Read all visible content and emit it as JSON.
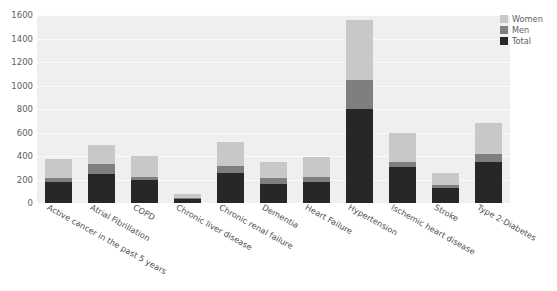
{
  "chart_data": {
    "type": "bar",
    "stacked": false,
    "overlaid": true,
    "title": "",
    "xlabel": "",
    "ylabel": "",
    "ylim": [
      0,
      1600
    ],
    "ytick_step": 200,
    "yticks": [
      "0",
      "200",
      "400",
      "600",
      "800",
      "1000",
      "1200",
      "1400",
      "1600"
    ],
    "grid": true,
    "grid_axis": "y",
    "legend_position": "upper-right-outside",
    "categories": [
      "Active cancer in the past 5 years",
      "Atrial Fibrillation",
      "COPD",
      "Chronic liver disease",
      "Chronic renal failure",
      "Dementia",
      "Heart Failure",
      "Hypertension",
      "Ischemic heart disease",
      "Stroke",
      "Type 2-Diabetes"
    ],
    "series": [
      {
        "name": "Women",
        "color": "#c8c8c8",
        "values": [
          375,
          495,
          400,
          75,
          520,
          350,
          390,
          1560,
          600,
          255,
          685
        ]
      },
      {
        "name": "Men",
        "color": "#7f7f7f",
        "values": [
          215,
          330,
          225,
          42,
          315,
          215,
          225,
          1045,
          345,
          150,
          415
        ]
      },
      {
        "name": "Total",
        "color": "#272727",
        "values": [
          180,
          250,
          195,
          38,
          255,
          165,
          175,
          800,
          310,
          130,
          345
        ]
      }
    ]
  },
  "legend": {
    "entries": [
      {
        "label": "Women",
        "color": "#c8c8c8"
      },
      {
        "label": "Men",
        "color": "#7f7f7f"
      },
      {
        "label": "Total",
        "color": "#272727"
      }
    ]
  },
  "colors": {
    "plot_background": "#efefef",
    "page_background": "#ffffff",
    "gridline": "#fbfbfb",
    "tick_text": "#5d5d5d"
  }
}
